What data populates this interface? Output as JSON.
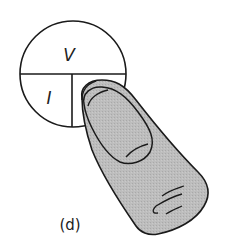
{
  "diagram": {
    "circle": {
      "top_label": "V",
      "bottom_left_label": "I",
      "bottom_right_label_hidden": "R"
    },
    "finger": {
      "covering": "R",
      "fill_color": "#b9b9b9",
      "outline_color": "#1a1a1a"
    },
    "caption": "(d)"
  }
}
